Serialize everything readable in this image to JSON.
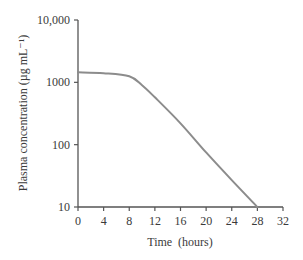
{
  "chart_data": {
    "type": "line",
    "title": "",
    "xlabel": "Time  (hours)",
    "ylabel": "Plasma concentration (µg mL⁻¹)",
    "yscale": "log",
    "xlim": [
      0,
      32
    ],
    "ylim": [
      10,
      10000
    ],
    "x_ticks": [
      0,
      4,
      8,
      12,
      16,
      20,
      24,
      28,
      32
    ],
    "x_tick_labels": [
      "0",
      "4",
      "8",
      "12",
      "16",
      "20",
      "24",
      "28",
      "32"
    ],
    "y_ticks": [
      10,
      100,
      1000,
      10000
    ],
    "y_tick_labels": [
      "10",
      "100",
      "1000",
      "10,000"
    ],
    "grid": false,
    "legend": null,
    "series": [
      {
        "name": "Plasma concentration",
        "color": "#8c8c8c",
        "x": [
          0,
          4,
          8,
          10,
          12,
          16,
          20,
          24,
          28
        ],
        "y": [
          1450,
          1400,
          1250,
          900,
          575,
          220,
          75,
          27,
          10
        ]
      }
    ]
  },
  "colors": {
    "axis": "#555555",
    "line": "#8c8c8c",
    "text": "#3a3a3a"
  }
}
